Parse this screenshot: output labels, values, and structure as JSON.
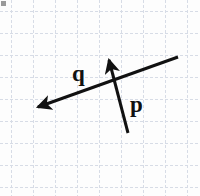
{
  "figure": {
    "type": "vector-diagram",
    "width": 200,
    "height": 196,
    "background_color": "#fdfdfd",
    "corner_marker": {
      "name": "corner-square-marker",
      "color": "#9a9a9a",
      "x": 1,
      "y": 1,
      "size": 5
    },
    "grid": {
      "visible": true,
      "style": "dashed",
      "color": "#d7dce6",
      "spacing": 22,
      "origin_x": 11,
      "origin_y": 11,
      "columns": 9,
      "rows": 9
    },
    "vectors": [
      {
        "id": "q",
        "label": "q",
        "label_x": 72,
        "label_y": 81,
        "color": "#111111",
        "tail_x": 178,
        "tail_y": 57,
        "tip_x": 38,
        "tip_y": 107,
        "stroke_width": 3,
        "arrowhead": "tip",
        "direction": "down-left"
      },
      {
        "id": "p",
        "label": "p",
        "label_x": 130,
        "label_y": 112,
        "color": "#111111",
        "tail_x": 128,
        "tail_y": 133,
        "tip_x": 109,
        "tip_y": 60,
        "stroke_width": 3,
        "arrowhead": "tip",
        "direction": "up-left"
      }
    ]
  }
}
